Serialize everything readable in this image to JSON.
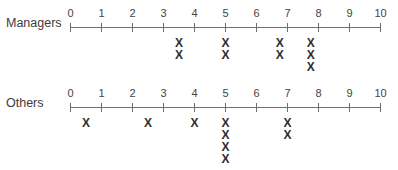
{
  "chart_data": [
    {
      "type": "dot-plot",
      "title": "",
      "row_label": "Managers",
      "xlabel": "",
      "ylabel": "",
      "xlim": [
        0,
        10
      ],
      "ticks": [
        0,
        1,
        2,
        3,
        4,
        5,
        6,
        7,
        8,
        9,
        10
      ],
      "tick_labels": [
        "0",
        "1",
        "2",
        "3",
        "4",
        "5",
        "6",
        "7",
        "8",
        "9",
        "10"
      ],
      "marker": "X",
      "points": [
        {
          "x": 3.5,
          "count": 2
        },
        {
          "x": 5,
          "count": 2
        },
        {
          "x": 6.75,
          "count": 2
        },
        {
          "x": 7.75,
          "count": 3
        }
      ],
      "values": [
        3.5,
        3.5,
        5,
        5,
        6.75,
        6.75,
        7.75,
        7.75,
        7.75
      ],
      "grid": false
    },
    {
      "type": "dot-plot",
      "title": "",
      "row_label": "Others",
      "xlabel": "",
      "ylabel": "",
      "xlim": [
        0,
        10
      ],
      "ticks": [
        0,
        1,
        2,
        3,
        4,
        5,
        6,
        7,
        8,
        9,
        10
      ],
      "tick_labels": [
        "0",
        "1",
        "2",
        "3",
        "4",
        "5",
        "6",
        "7",
        "8",
        "9",
        "10"
      ],
      "marker": "X",
      "points": [
        {
          "x": 0.5,
          "count": 1
        },
        {
          "x": 2.5,
          "count": 1
        },
        {
          "x": 4,
          "count": 1
        },
        {
          "x": 5,
          "count": 4
        },
        {
          "x": 7,
          "count": 2
        }
      ],
      "values": [
        0.5,
        2.5,
        4,
        5,
        5,
        5,
        5,
        7,
        7
      ],
      "grid": false
    }
  ],
  "rows": [
    {
      "label": "Managers",
      "axis_y": 27
    },
    {
      "label": "Others",
      "axis_y": 107
    }
  ],
  "marker_glyph": "X",
  "colors": {
    "axis": "#6e6e6e",
    "text": "#3c3c3c",
    "marker": "#2e2e2e"
  }
}
